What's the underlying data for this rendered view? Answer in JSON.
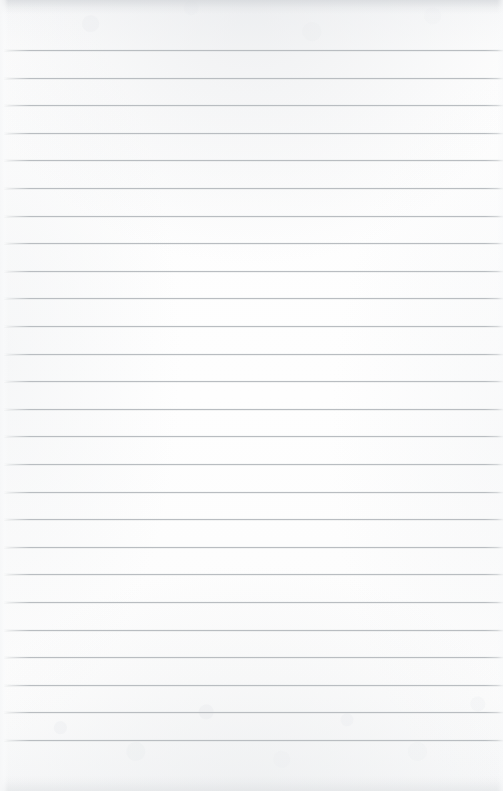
{
  "document": {
    "kind": "scanned-ruled-notepad-page",
    "title": "Blank Ruled Notepad Page",
    "has_text_content": false,
    "visible_text": "",
    "orientation": "portrait",
    "width_px": 503,
    "height_px": 791
  },
  "paper": {
    "background_color": "#fdfdfd",
    "background_color_top_band": "#f7f8f9",
    "background_color_bottom_band": "#f6f7f8",
    "texture": "faint mottled scan grain near top and bottom edges",
    "edge_shadow_top_color": "#ced1d5",
    "edge_shadow_bottom_color": "#d6d9dc"
  },
  "ruling": {
    "line_color": "#b9bdc1",
    "line_thickness_px": 1,
    "line_count": 26,
    "first_line_y": 50,
    "last_line_y": 740,
    "line_spacing_px": 27.6,
    "line_start_x": 4,
    "line_end_x": 503,
    "margin_rule": "none",
    "header_space_px": 50,
    "footer_space_px": 51,
    "lines": [
      {
        "index": 1,
        "y": 50,
        "x1": 4,
        "x2": 503
      },
      {
        "index": 2,
        "y": 78,
        "x1": 4,
        "x2": 503
      },
      {
        "index": 3,
        "y": 105,
        "x1": 4,
        "x2": 503
      },
      {
        "index": 4,
        "y": 133,
        "x1": 4,
        "x2": 503
      },
      {
        "index": 5,
        "y": 160,
        "x1": 4,
        "x2": 503
      },
      {
        "index": 6,
        "y": 188,
        "x1": 4,
        "x2": 503
      },
      {
        "index": 7,
        "y": 216,
        "x1": 4,
        "x2": 503
      },
      {
        "index": 8,
        "y": 243,
        "x1": 4,
        "x2": 503
      },
      {
        "index": 9,
        "y": 271,
        "x1": 4,
        "x2": 503
      },
      {
        "index": 10,
        "y": 298,
        "x1": 4,
        "x2": 503
      },
      {
        "index": 11,
        "y": 326,
        "x1": 4,
        "x2": 503
      },
      {
        "index": 12,
        "y": 354,
        "x1": 4,
        "x2": 503
      },
      {
        "index": 13,
        "y": 381,
        "x1": 4,
        "x2": 503
      },
      {
        "index": 14,
        "y": 409,
        "x1": 4,
        "x2": 503
      },
      {
        "index": 15,
        "y": 436,
        "x1": 4,
        "x2": 503
      },
      {
        "index": 16,
        "y": 464,
        "x1": 4,
        "x2": 503
      },
      {
        "index": 17,
        "y": 492,
        "x1": 4,
        "x2": 503
      },
      {
        "index": 18,
        "y": 519,
        "x1": 4,
        "x2": 503
      },
      {
        "index": 19,
        "y": 547,
        "x1": 4,
        "x2": 503
      },
      {
        "index": 20,
        "y": 574,
        "x1": 4,
        "x2": 503
      },
      {
        "index": 21,
        "y": 602,
        "x1": 4,
        "x2": 503
      },
      {
        "index": 22,
        "y": 630,
        "x1": 4,
        "x2": 503
      },
      {
        "index": 23,
        "y": 657,
        "x1": 4,
        "x2": 503
      },
      {
        "index": 24,
        "y": 685,
        "x1": 4,
        "x2": 503
      },
      {
        "index": 25,
        "y": 712,
        "x1": 4,
        "x2": 503
      },
      {
        "index": 26,
        "y": 740,
        "x1": 4,
        "x2": 503
      }
    ]
  }
}
